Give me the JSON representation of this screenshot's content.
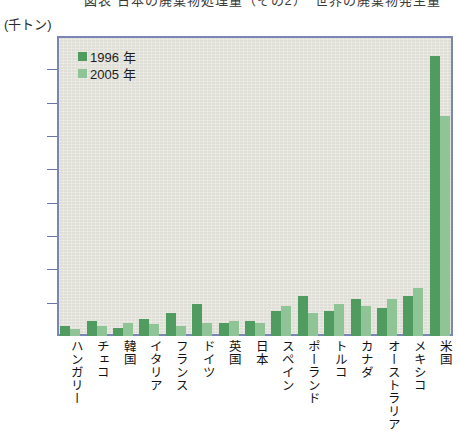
{
  "title_strip": {
    "text": "図表 日本の廃棄物処理量（その2）　世界の廃棄物発生量"
  },
  "axis": {
    "unit_label": "(千トン)",
    "y_ticks": [
      "18,000",
      "16,000",
      "14,000",
      "12,000",
      "10,000",
      "8,000",
      "6,000",
      "4,000",
      "2,000",
      "0"
    ]
  },
  "legend": {
    "items": [
      {
        "label": "1996 年",
        "color": "#4f9b60",
        "swatch": "legend-swatch-1996"
      },
      {
        "label": "2005 年",
        "color": "#8fc596",
        "swatch": "legend-swatch-2005"
      }
    ]
  },
  "chart_data": {
    "type": "bar",
    "title": "図表 日本の廃棄物処理量（その2）　世界の廃棄物発生量",
    "xlabel": "",
    "ylabel": "(千トン)",
    "ylim": [
      0,
      18000
    ],
    "ytick_step": 2000,
    "grid": false,
    "legend_position": "top-left",
    "categories": [
      "ハンガリー",
      "チェコ",
      "韓国",
      "イタリア",
      "フランス",
      "ドイツ",
      "英国",
      "日本",
      "スペイン",
      "ポーランド",
      "トルコ",
      "カナダ",
      "オーストラリア",
      "メキシコ",
      "米国"
    ],
    "series": [
      {
        "name": "1996 年",
        "color": "#4f9b60",
        "values": [
          600,
          900,
          500,
          1050,
          1400,
          1900,
          800,
          900,
          1500,
          2400,
          1500,
          2250,
          1700,
          2400,
          16800
        ]
      },
      {
        "name": "2005 年",
        "color": "#8fc596",
        "values": [
          450,
          600,
          800,
          700,
          600,
          800,
          900,
          800,
          1800,
          1400,
          1900,
          1800,
          2200,
          2900,
          13200
        ]
      }
    ]
  },
  "colors": {
    "plot_background": "#dfded7",
    "frame_border": "#7b86b5",
    "series_1996": "#4f9b60",
    "series_2005": "#8fc596",
    "page_background": "#ffffff"
  }
}
